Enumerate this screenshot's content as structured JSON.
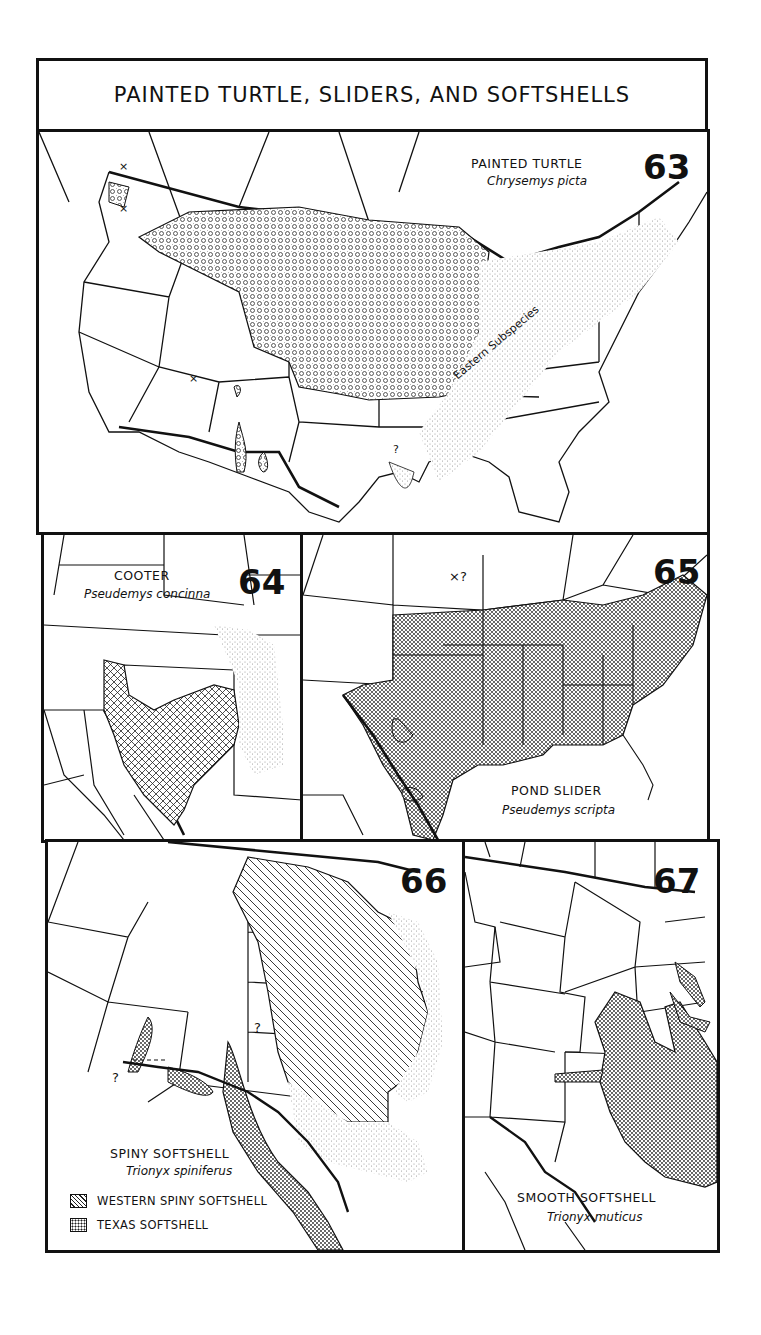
{
  "title": "PAINTED TURTLE, SLIDERS, AND SOFTSHELLS",
  "colors": {
    "ink": "#111111",
    "paper": "#ffffff",
    "stipple": "#9a9a9a"
  },
  "maps": [
    {
      "number": "63",
      "common_name": "PAINTED TURTLE",
      "scientific_name": "Chrysemys picta",
      "annotations": [
        "Eastern Subspecies",
        "?",
        "×",
        "×",
        "×"
      ],
      "fill_pattern": "circle-stipple"
    },
    {
      "number": "64",
      "common_name": "COOTER",
      "scientific_name": "Pseudemys concinna",
      "fill_pattern": "crosshatch"
    },
    {
      "number": "65",
      "common_name": "POND SLIDER",
      "scientific_name": "Pseudemys scripta",
      "annotations": [
        "×?"
      ],
      "fill_pattern": "dot-stipple"
    },
    {
      "number": "66",
      "common_name": "SPINY SOFTSHELL",
      "scientific_name": "Trionyx spiniferus",
      "annotations": [
        "?",
        "?"
      ],
      "legend": [
        {
          "label": "WESTERN SPINY SOFTSHELL",
          "pattern": "diagonal-hatch"
        },
        {
          "label": "TEXAS SOFTSHELL",
          "pattern": "dot-stipple"
        }
      ]
    },
    {
      "number": "67",
      "common_name": "SMOOTH SOFTSHELL",
      "scientific_name": "Trionyx muticus",
      "fill_pattern": "dot-stipple"
    }
  ]
}
